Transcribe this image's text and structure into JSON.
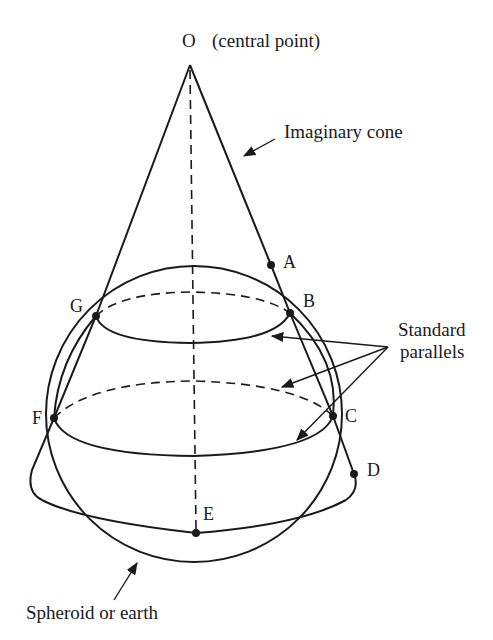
{
  "figure": {
    "type": "conic projection diagram",
    "colors": {
      "ink": "#1a1a1a",
      "background": "#ffffff"
    }
  },
  "labels": {
    "apex": "O",
    "apex_note": "(central point)",
    "cone": "Imaginary cone",
    "parallels_line1": "Standard",
    "parallels_line2": "parallels",
    "sphere": "Spheroid or earth"
  },
  "points": [
    {
      "id": "O",
      "label": "O"
    },
    {
      "id": "A",
      "label": "A"
    },
    {
      "id": "B",
      "label": "B"
    },
    {
      "id": "C",
      "label": "C"
    },
    {
      "id": "D",
      "label": "D"
    },
    {
      "id": "E",
      "label": "E"
    },
    {
      "id": "F",
      "label": "F"
    },
    {
      "id": "G",
      "label": "G"
    }
  ]
}
